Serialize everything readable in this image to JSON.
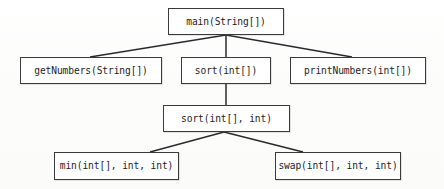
{
  "diagram": {
    "type": "call-graph",
    "background_color": "#fdfdfc",
    "box_border_color": "#3a3a3a",
    "edge_color": "#2b2b2b",
    "text_color": "#1c1c1c",
    "nodes": [
      {
        "id": "main",
        "label": "main(String[])",
        "level": 0,
        "x": 168,
        "y": 8,
        "w": 116,
        "h": 27
      },
      {
        "id": "getNumbers",
        "label": "getNumbers(String[])",
        "level": 1,
        "x": 20,
        "y": 57,
        "w": 142,
        "h": 27
      },
      {
        "id": "sort1",
        "label": "sort(int[])",
        "level": 1,
        "x": 181,
        "y": 57,
        "w": 90,
        "h": 27
      },
      {
        "id": "printNumbers",
        "label": "printNumbers(int[])",
        "level": 1,
        "x": 290,
        "y": 57,
        "w": 136,
        "h": 27
      },
      {
        "id": "sort2",
        "label": "sort(int[], int)",
        "level": 2,
        "x": 163,
        "y": 105,
        "w": 127,
        "h": 27
      },
      {
        "id": "min",
        "label": "min(int[], int, int)",
        "level": 3,
        "x": 54,
        "y": 152,
        "w": 125,
        "h": 28
      },
      {
        "id": "swap",
        "label": "swap(int[], int, int)",
        "level": 3,
        "x": 275,
        "y": 152,
        "w": 126,
        "h": 28
      }
    ],
    "edges": [
      {
        "id": "main-getNumbers",
        "from": "main",
        "to": "getNumbers",
        "x1": 226,
        "y1": 35,
        "x2": 90,
        "y2": 57
      },
      {
        "id": "main-sort1",
        "from": "main",
        "to": "sort1",
        "x1": 226,
        "y1": 35,
        "x2": 226,
        "y2": 57
      },
      {
        "id": "main-printNumbers",
        "from": "main",
        "to": "printNumbers",
        "x1": 226,
        "y1": 35,
        "x2": 352,
        "y2": 57
      },
      {
        "id": "sort1-sort2",
        "from": "sort1",
        "to": "sort2",
        "x1": 226,
        "y1": 84,
        "x2": 226,
        "y2": 105
      },
      {
        "id": "sort2-min",
        "from": "sort2",
        "to": "min",
        "x1": 224,
        "y1": 132,
        "x2": 150,
        "y2": 152
      },
      {
        "id": "sort2-swap",
        "from": "sort2",
        "to": "swap",
        "x1": 224,
        "y1": 132,
        "x2": 303,
        "y2": 152
      }
    ]
  }
}
